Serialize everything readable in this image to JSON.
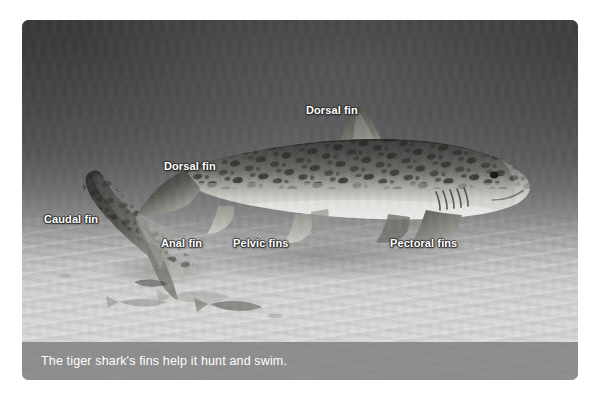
{
  "figure": {
    "kind": "labeled-photograph",
    "subject": "tiger shark",
    "caption": "The tiger shark's fins help it hunt and swim.",
    "labels": [
      {
        "id": "dorsal-fin-first",
        "text": "Dorsal fin",
        "x": 306,
        "y": 104
      },
      {
        "id": "dorsal-fin-second",
        "text": "Dorsal fin",
        "x": 164,
        "y": 160
      },
      {
        "id": "caudal-fin",
        "text": "Caudal fin",
        "x": 44,
        "y": 213
      },
      {
        "id": "anal-fin",
        "text": "Anal fin",
        "x": 161,
        "y": 237
      },
      {
        "id": "pelvic-fins",
        "text": "Pelvic fins",
        "x": 233,
        "y": 237
      },
      {
        "id": "pectoral-fins",
        "text": "Pectoral fins",
        "x": 390,
        "y": 237
      }
    ],
    "colors": {
      "water_top": "#3f3f42",
      "water_mid": "#6e6e70",
      "sand": "#dcdcda",
      "caption_bar": "#808080",
      "label_text": "#ffffff",
      "shark_dorsal": "#4d4e4c",
      "shark_belly": "#e6e6e3"
    }
  }
}
